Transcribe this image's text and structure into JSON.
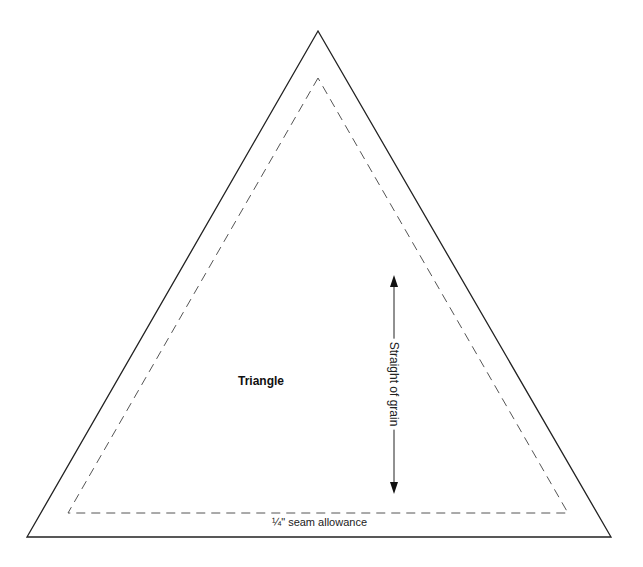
{
  "diagram": {
    "shape_label": "Triangle",
    "grain_label": "Straight of grain",
    "seam_label": "¼\" seam allowance",
    "colors": {
      "outline": "#222222",
      "seam_line": "#555555",
      "background": "#ffffff"
    },
    "outer_triangle": {
      "apex": [
        318,
        31
      ],
      "bottom_left": [
        27,
        537
      ],
      "bottom_right": [
        611,
        537
      ]
    },
    "inner_triangle": {
      "apex": [
        318,
        78
      ],
      "bottom_left": [
        68,
        513
      ],
      "bottom_right": [
        568,
        513
      ]
    },
    "grain_arrow": {
      "x": 394,
      "y_top": 275,
      "y_bottom": 494
    }
  }
}
